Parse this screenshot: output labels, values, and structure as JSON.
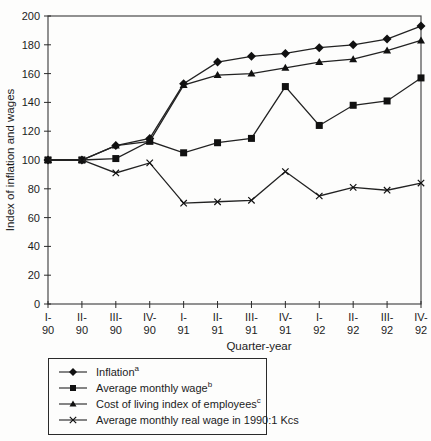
{
  "chart_data": {
    "type": "line",
    "title": "",
    "xlabel": "Quarter-year",
    "ylabel": "Index of inflation and wages",
    "ylim": [
      0,
      200
    ],
    "yticks": [
      0,
      20,
      40,
      60,
      80,
      100,
      120,
      140,
      160,
      180,
      200
    ],
    "categories": [
      "I-90",
      "II-90",
      "III-90",
      "IV-90",
      "I-91",
      "II-91",
      "III-91",
      "IV-91",
      "I-92",
      "II-92",
      "III-92",
      "IV-92"
    ],
    "grid": "off",
    "legend_position": "bottom-left-box",
    "line_color": "#222222",
    "marker_color": "#111111",
    "frame_color": "#4a4a4a",
    "series": [
      {
        "name": "Inflation",
        "sup": "a",
        "marker": "diamond",
        "values": [
          100,
          100,
          110,
          115,
          153,
          168,
          172,
          174,
          178,
          180,
          184,
          193
        ]
      },
      {
        "name": "Average monthly wage",
        "sup": "b",
        "marker": "square",
        "values": [
          100,
          100,
          101,
          113,
          105,
          112,
          115,
          151,
          124,
          138,
          141,
          157
        ]
      },
      {
        "name": "Cost of living index of employees",
        "sup": "c",
        "marker": "triangle",
        "values": [
          100,
          100,
          110,
          113,
          152,
          159,
          160,
          164,
          168,
          170,
          176,
          183
        ]
      },
      {
        "name": "Average monthly real wage in 1990:1 Kcs",
        "sup": "",
        "marker": "x",
        "values": [
          100,
          100,
          91,
          98,
          70,
          71,
          72,
          92,
          75,
          81,
          79,
          84
        ]
      }
    ]
  }
}
